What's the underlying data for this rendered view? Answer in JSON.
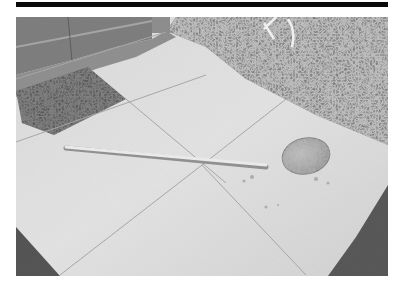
{
  "figure": {
    "description": "Grayscale photograph of a long-handled metal ladle lying on concrete paving slabs beside a doorway with a dark doormat; leaf litter and plants at the top right and shadowed gravel at the lower corners.",
    "subjects": [
      "ladle",
      "paving slabs",
      "doormat",
      "door",
      "leaf litter",
      "gravel"
    ],
    "colors": {
      "rule": "#0a0a0a",
      "slab_light": "#d6d6d6",
      "slab_mid": "#bdbdbd",
      "door": "#5a5a5a",
      "mat": "#2a2a2a",
      "foliage": "#6e6e6e",
      "ladle_bowl": "#8a8a8a",
      "handle": "#e2e2e2",
      "shadow": "#1e1e1e"
    }
  }
}
